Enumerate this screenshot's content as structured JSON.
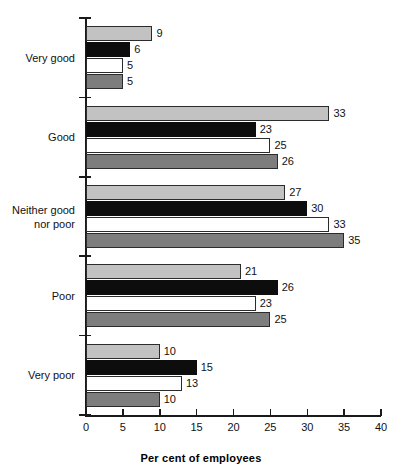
{
  "chart_data": {
    "type": "bar",
    "orientation": "horizontal",
    "title": "",
    "subtitle": "",
    "xlabel": "Per cent of employees",
    "ylabel": "",
    "xlim": [
      0,
      40
    ],
    "xticks": [
      0,
      5,
      10,
      15,
      20,
      25,
      30,
      35,
      40
    ],
    "xtick_labels": [
      "0",
      "5",
      "10",
      "15",
      "20",
      "25",
      "30",
      "35",
      "40"
    ],
    "grid": false,
    "legend": "none",
    "categories": [
      "Very good",
      "Neither good\nnor poor",
      "Good",
      "Poor",
      "Very poor"
    ],
    "category_order": [
      "Very good",
      "Good",
      "Neither good\nnor poor",
      "Poor",
      "Very poor"
    ],
    "series": [
      {
        "name": "series-1",
        "color": "#c2c2c2",
        "values": [
          9,
          33,
          27,
          21,
          10
        ]
      },
      {
        "name": "series-2",
        "color": "#0d0d0d",
        "values": [
          6,
          23,
          30,
          26,
          15
        ]
      },
      {
        "name": "series-3",
        "color": "#ffffff",
        "values": [
          5,
          25,
          33,
          23,
          13
        ]
      },
      {
        "name": "series-4",
        "color": "#7d7d7d",
        "values": [
          5,
          26,
          35,
          25,
          10
        ]
      }
    ],
    "groups": [
      {
        "label": "Very good",
        "bars": [
          {
            "series": "series-1",
            "value": 9,
            "label": "9"
          },
          {
            "series": "series-2",
            "value": 6,
            "label": "6"
          },
          {
            "series": "series-3",
            "value": 5,
            "label": "5"
          },
          {
            "series": "series-4",
            "value": 5,
            "label": "5"
          }
        ]
      },
      {
        "label": "Good",
        "bars": [
          {
            "series": "series-1",
            "value": 33,
            "label": "33"
          },
          {
            "series": "series-2",
            "value": 23,
            "label": "23"
          },
          {
            "series": "series-3",
            "value": 25,
            "label": "25"
          },
          {
            "series": "series-4",
            "value": 26,
            "label": "26"
          }
        ]
      },
      {
        "label": "Neither good\nnor poor",
        "bars": [
          {
            "series": "series-1",
            "value": 27,
            "label": "27"
          },
          {
            "series": "series-2",
            "value": 30,
            "label": "30"
          },
          {
            "series": "series-3",
            "value": 33,
            "label": "33"
          },
          {
            "series": "series-4",
            "value": 35,
            "label": "35"
          }
        ]
      },
      {
        "label": "Poor",
        "bars": [
          {
            "series": "series-1",
            "value": 21,
            "label": "21"
          },
          {
            "series": "series-2",
            "value": 26,
            "label": "26"
          },
          {
            "series": "series-3",
            "value": 23,
            "label": "23"
          },
          {
            "series": "series-4",
            "value": 25,
            "label": "25"
          }
        ]
      },
      {
        "label": "Very poor",
        "bars": [
          {
            "series": "series-1",
            "value": 10,
            "label": "10"
          },
          {
            "series": "series-2",
            "value": 15,
            "label": "15"
          },
          {
            "series": "series-3",
            "value": 13,
            "label": "13"
          },
          {
            "series": "series-4",
            "value": 10,
            "label": "10"
          }
        ]
      }
    ]
  }
}
